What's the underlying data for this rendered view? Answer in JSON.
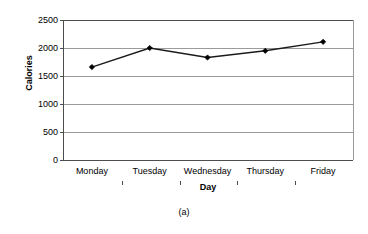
{
  "chart_data": {
    "type": "line",
    "title": "",
    "subtitle": "",
    "xlabel": "Day",
    "ylabel": "Calories",
    "categories": [
      "Monday",
      "Tuesday",
      "Wednesday",
      "Thursday",
      "Friday"
    ],
    "values": [
      1660,
      2000,
      1830,
      1950,
      2110
    ],
    "series": [
      {
        "name": "Calories",
        "values": [
          1660,
          2000,
          1830,
          1950,
          2110
        ]
      }
    ],
    "ylim": [
      0,
      2500
    ],
    "ytick_labels": [
      "2500",
      "2000",
      "1500",
      "1000",
      "500",
      "0"
    ],
    "ytick_values": [
      2500,
      2000,
      1500,
      1000,
      500,
      0
    ],
    "ytick_step": 500,
    "grid": "horizontal",
    "legend": "none",
    "marker": "diamond",
    "line_color": "#1a1a1a",
    "marker_color": "#000000",
    "grid_color": "#9a9a9a",
    "axis_color": "#4d4d4d",
    "background": "#ffffff"
  },
  "caption": {
    "label": "(a)"
  }
}
